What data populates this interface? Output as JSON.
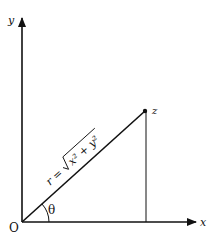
{
  "diagram": {
    "type": "polar-coordinates",
    "axes": {
      "x_label": "x",
      "y_label": "y",
      "origin_label": "O"
    },
    "point_label": "z",
    "radius_label": "r = √(x² + y²)",
    "radius_prefix": "r =",
    "radius_expr": "x² + y²",
    "angle_label": "θ",
    "colors": {
      "line": "#111111",
      "background": "#ffffff"
    }
  }
}
